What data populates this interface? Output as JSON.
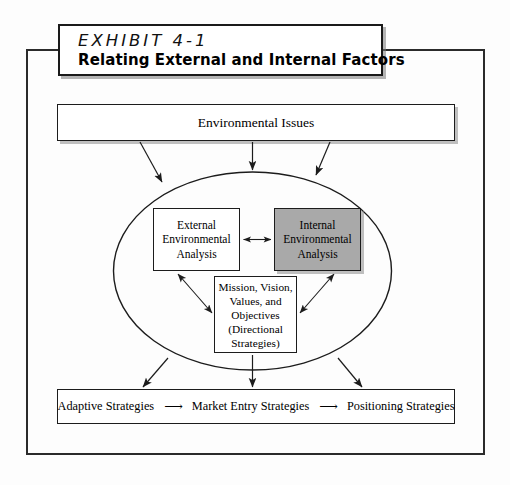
{
  "exhibit": {
    "number_label": "EXHIBIT 4-1",
    "subtitle": "Relating External and Internal Factors"
  },
  "diagram": {
    "type": "flow-diagram",
    "environmental_issues": {
      "label": "Environmental Issues"
    },
    "ellipse": {
      "label": "organizational-boundary-ellipse"
    },
    "external_analysis": {
      "line1": "External",
      "line2": "Environmental",
      "line3": "Analysis",
      "fill": "#ffffff"
    },
    "internal_analysis": {
      "line1": "Internal",
      "line2": "Environmental",
      "line3": "Analysis",
      "fill": "#a9a9a9"
    },
    "directional_strategies": {
      "line1": "Mission, Vision,",
      "line2": "Values, and",
      "line3": "Objectives",
      "line4": "(Directional",
      "line5": "Strategies)"
    },
    "strategies_row": {
      "item1": "Adaptive Strategies",
      "arrow1": "⟶",
      "item2": "Market Entry Strategies",
      "arrow2": "⟶",
      "item3": "Positioning Strategies"
    }
  },
  "colors": {
    "line": "#1c1c1c",
    "internal_fill": "#a9a9a9",
    "page_background": "#fdfdfd"
  }
}
